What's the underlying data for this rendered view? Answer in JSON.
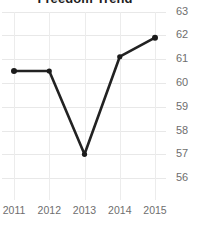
{
  "chart_data": {
    "type": "line",
    "title": "Freedom Trend",
    "xlabel": "",
    "ylabel": "",
    "categories": [
      "2011",
      "2012",
      "2013",
      "2014",
      "2015"
    ],
    "x": [
      2011,
      2012,
      2013,
      2014,
      2015
    ],
    "series": [
      {
        "name": "Freedom",
        "values": [
          60.5,
          60.5,
          57.0,
          61.1,
          61.9
        ]
      }
    ],
    "ylim": [
      55.5,
      63.4
    ],
    "yticks": [
      63,
      62,
      61,
      60,
      59,
      58,
      57,
      56
    ],
    "ytick_labels": [
      "63",
      "62",
      "61",
      "60",
      "59",
      "58",
      "57",
      "56"
    ],
    "xtick_labels": [
      "2011",
      "2012",
      "2013",
      "2014",
      "2015"
    ],
    "grid": true,
    "grid_axis": "both",
    "legend": false,
    "legend_position": "none",
    "y_axis_side": "right",
    "markers": true,
    "colors": {
      "line": "#222222",
      "marker": "#1b1b1b",
      "grid": "#e8e8e8",
      "grid_vertical": "#ececec",
      "tick_text": "#6e6e6e",
      "title_text": "#1d1d1d",
      "background": "#ffffff"
    }
  }
}
